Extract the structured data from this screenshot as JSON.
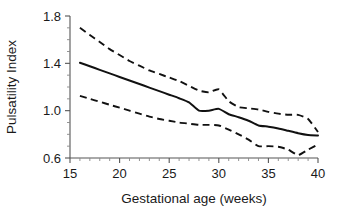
{
  "chart_data": {
    "type": "line",
    "title": "",
    "xlabel": "Gestational age (weeks)",
    "ylabel": "Pulsatility Index",
    "xlim": [
      15,
      40
    ],
    "ylim": [
      0.6,
      1.8
    ],
    "xticks": [
      15,
      20,
      25,
      30,
      35,
      40
    ],
    "xtick_labels": [
      "15",
      "20",
      "25",
      "30",
      "35",
      "40"
    ],
    "yticks": [
      0.6,
      1.0,
      1.4,
      1.8
    ],
    "ytick_labels": [
      "0.6",
      "1.0",
      "1.4",
      "1.8"
    ],
    "x_minor_interval": 1,
    "y_minor_interval": 0.1,
    "grid": false,
    "legend": "none",
    "x": [
      16,
      17,
      18,
      19,
      20,
      21,
      22,
      23,
      24,
      25,
      26,
      27,
      28,
      29,
      30,
      31,
      32,
      33,
      34,
      35,
      36,
      37,
      38,
      39,
      40
    ],
    "series": [
      {
        "name": "Upper band (95th centile)",
        "style": "dashed",
        "color": "#111111",
        "values": [
          1.7,
          1.64,
          1.58,
          1.52,
          1.47,
          1.42,
          1.38,
          1.34,
          1.31,
          1.28,
          1.25,
          1.21,
          1.17,
          1.155,
          1.18,
          1.08,
          1.03,
          1.02,
          1.01,
          0.99,
          0.975,
          0.965,
          0.965,
          0.93,
          0.82
        ]
      },
      {
        "name": "Median (50th centile)",
        "style": "solid",
        "color": "#111111",
        "values": [
          1.405,
          1.375,
          1.345,
          1.315,
          1.285,
          1.255,
          1.225,
          1.195,
          1.165,
          1.135,
          1.105,
          1.07,
          1.0,
          1.0,
          1.015,
          0.97,
          0.945,
          0.915,
          0.875,
          0.865,
          0.85,
          0.83,
          0.81,
          0.795,
          0.79
        ]
      },
      {
        "name": "Lower band (5th centile)",
        "style": "dashed",
        "color": "#111111",
        "values": [
          1.125,
          1.1,
          1.075,
          1.05,
          1.025,
          1.0,
          0.975,
          0.95,
          0.93,
          0.915,
          0.9,
          0.89,
          0.88,
          0.88,
          0.875,
          0.84,
          0.8,
          0.755,
          0.7,
          0.7,
          0.695,
          0.67,
          0.625,
          0.67,
          0.715
        ]
      }
    ]
  },
  "axes": {
    "y_axis_name": "pulsatility-index-axis",
    "x_axis_name": "gestational-age-axis"
  }
}
